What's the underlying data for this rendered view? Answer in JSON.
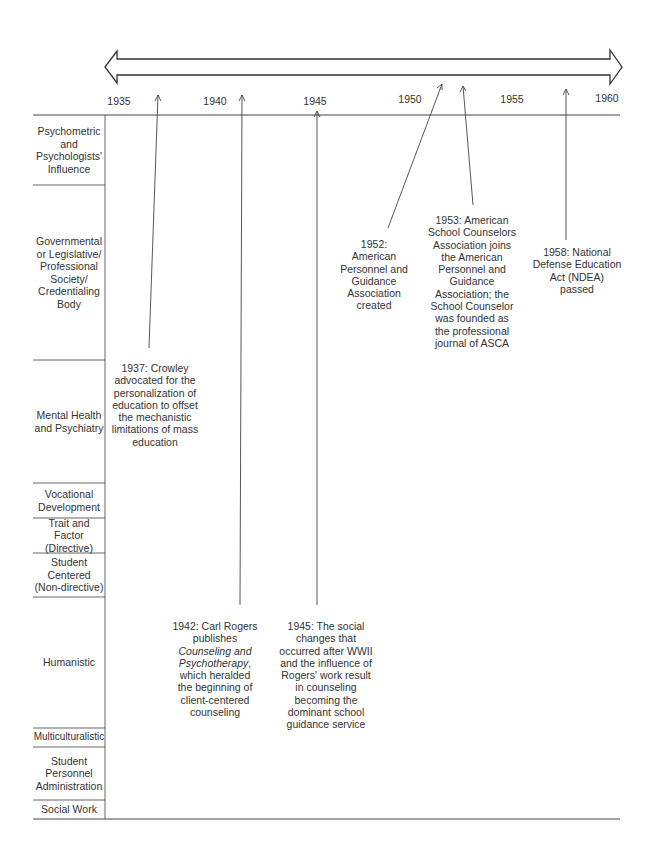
{
  "timeline": {
    "years": [
      "1935",
      "1940",
      "1945",
      "1950",
      "1955",
      "1960"
    ],
    "range": [
      1935,
      1960
    ]
  },
  "categories": [
    "Psychometric and Psychologists' Influence",
    "Governmental or Legislative/ Professional Society/ Credentialing Body",
    "Mental Health and Psychiatry",
    "Vocational Development",
    "Trait and Factor (Directive)",
    "Student Centered (Non-directive)",
    "Humanistic",
    "Multiculturalistic",
    "Student Personnel Administration",
    "Social Work"
  ],
  "events": [
    {
      "year": "1937",
      "text_pre": "1937: Crowley advocated for the personalization of education to offset the mechanistic limitations of mass education",
      "category": "Mental Health and Psychiatry"
    },
    {
      "year": "1942",
      "text_pre": "1942: Carl Rogers publishes",
      "text_italic": "Counseling and Psychotherapy",
      "text_post": ", which heralded the beginning of client-centered counseling",
      "category": "Humanistic"
    },
    {
      "year": "1945",
      "text_pre": "1945: The social changes that occurred after WWII and the influence of Rogers' work result in counseling becoming the dominant school guidance service",
      "category": "Humanistic"
    },
    {
      "year": "1952",
      "text_pre": "1952: American Personnel and Guidance Association created",
      "category": "Governmental or Legislative/ Professional Society/ Credentialing Body"
    },
    {
      "year": "1953",
      "text_pre": "1953: American School Counselors Association joins the American Personnel and Guidance Association; the School Counselor was founded as the professional journal of ASCA",
      "category": "Governmental or Legislative/ Professional Society/ Credentialing Body"
    },
    {
      "year": "1958",
      "text_pre": "1958: National Defense Education Act (NDEA) passed",
      "category": "Governmental or Legislative/ Professional Society/ Credentialing Body"
    }
  ]
}
